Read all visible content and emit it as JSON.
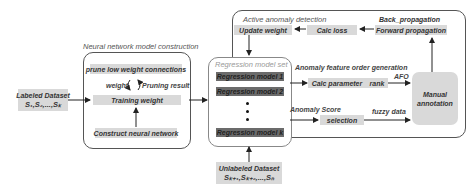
{
  "diagram": {
    "labeled_dataset": {
      "title": "Labeled Dataset",
      "formula": "S₁,S₂,...,Sₖ"
    },
    "unlabeled_dataset": {
      "title": "Unlabeled Dataset",
      "formula": "Sₖ₊₁,Sₖ₊₂,...,Sₙ"
    },
    "nn_construction": {
      "title": "Neural network model construction",
      "prune": "prune low weight connections",
      "weight": "weight",
      "pruning_result": "Pruning result",
      "training": "Training weight",
      "construct": "Construct neural network"
    },
    "regression_set": {
      "title": "Regression model set",
      "models": [
        "Regression model 1",
        "Regression model 2",
        "Regression model k"
      ]
    },
    "active_detection": {
      "title": "Active anomaly detection",
      "back_propagation": "Back_propagation",
      "update_weight": "Update weight",
      "calc_loss": "Calc loss",
      "forward_propagation": "Forward propagation",
      "feature_order_title": "Anomaly feature order generation",
      "calc_parameter": "Calc parameter",
      "rank": "rank",
      "afo": "AFO",
      "anomaly_score": "Anomaly Score",
      "selection": "selection",
      "fuzzy_data": "fuzzy data",
      "manual_annotation": "Manual annotation"
    }
  }
}
